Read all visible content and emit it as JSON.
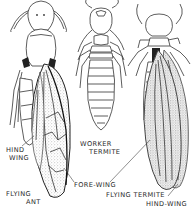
{
  "figure": {
    "subjects": [
      "Flying Ant",
      "Worker Termite",
      "Flying Termite"
    ],
    "colors": {
      "ink": "#333333",
      "paper": "#ffffff",
      "stipple": "#9a9a9a"
    }
  },
  "labels": {
    "hind_wing_ant_line1": "HIND",
    "hind_wing_ant_line2": "WING",
    "worker_termite_line1": "WORKER",
    "worker_termite_line2": "TERMITE",
    "flying_ant_line1": "FLYING",
    "flying_ant_line2": "ANT",
    "fore_wing": "FORE-WING",
    "flying_termite": "FLYING TERMITE",
    "hind_wing_termite": "HIND-WING"
  }
}
